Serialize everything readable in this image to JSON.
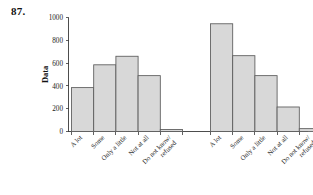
{
  "figure": {
    "problem_number": "87."
  },
  "chart_data": {
    "type": "bar",
    "title": "",
    "xlabel": "",
    "ylabel": "Data",
    "ylim": [
      0,
      1000
    ],
    "yticks": [
      0,
      200,
      400,
      600,
      800,
      1000
    ],
    "ytick_labels": [
      "0",
      "200",
      "400",
      "600",
      "800",
      "1000"
    ],
    "grid": false,
    "legend": "none",
    "groups": [
      {
        "name": "group-1",
        "categories": [
          "A lot",
          "Some",
          "Only a little",
          "Not at all",
          "Do not know/refused"
        ],
        "values": [
          385,
          585,
          660,
          490,
          18
        ]
      },
      {
        "name": "group-2",
        "categories": [
          "A lot",
          "Some",
          "Only a little",
          "Not at all",
          "Do not know/refused"
        ],
        "values": [
          945,
          665,
          490,
          215,
          25
        ]
      }
    ],
    "bar_fill_color": "#d8d8d8",
    "bar_edge_color": "#5a5a5a",
    "axis_color": "#3a3a3a"
  }
}
